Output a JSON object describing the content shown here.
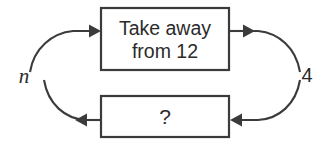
{
  "diagram": {
    "type": "function-machine-cycle",
    "background_color": "#ffffff",
    "line_color": "#3b3b3b",
    "text_color": "#2b2b2b",
    "boxes": [
      {
        "id": "operation-box",
        "line1": "Take away",
        "line2": "from 12"
      },
      {
        "id": "inverse-box",
        "label": "?"
      }
    ],
    "labels": {
      "input": "n",
      "output": "4"
    }
  }
}
